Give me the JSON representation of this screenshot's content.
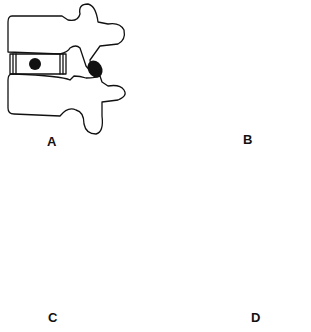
{
  "figure": {
    "panels": [
      {
        "label": "A",
        "description": "lateral view, disc with nucleus centered-posterior, facet joint (dark) between vertebrae"
      },
      {
        "label": "B",
        "description": "lateral view, anterior disc opening, nucleus anterior, enlarged facet contact"
      },
      {
        "label": "C",
        "description": "lateral view, posterior disc opening, nucleus posterior, narrow facet contact"
      },
      {
        "label": "D",
        "description": "posterior view, two rotated vertebrae overlapping, facet contact"
      }
    ]
  }
}
